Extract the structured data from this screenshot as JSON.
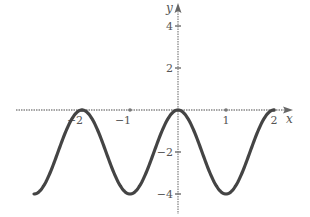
{
  "chart_data": {
    "type": "line",
    "title": "",
    "xlabel": "x",
    "ylabel": "y",
    "function": "y = 2cos(πx) - 2",
    "xlim": [
      -3,
      2.35
    ],
    "ylim": [
      -4.2,
      4.8
    ],
    "grid": false,
    "legend": null,
    "x_ticks": [
      {
        "value": -2,
        "label": "−2"
      },
      {
        "value": -1,
        "label": "−1"
      },
      {
        "value": 1,
        "label": "1"
      },
      {
        "value": 2,
        "label": "2"
      }
    ],
    "y_ticks": [
      {
        "value": 4,
        "label": "4"
      },
      {
        "value": 2,
        "label": "2"
      },
      {
        "value": -2,
        "label": "−2"
      },
      {
        "value": -4,
        "label": "−4"
      }
    ],
    "series": [
      {
        "name": "curve",
        "x": [
          -3,
          -2.5,
          -2,
          -1.5,
          -1,
          -0.5,
          0,
          0.5,
          1,
          1.5,
          2
        ],
        "y": [
          -4,
          -2,
          0,
          -2,
          -4,
          -2,
          0,
          -2,
          -4,
          -2,
          0
        ]
      }
    ],
    "key_points": {
      "maxima": [
        [
          -2,
          0
        ],
        [
          0,
          0
        ],
        [
          2,
          0
        ]
      ],
      "minima": [
        [
          -1,
          -4
        ],
        [
          1,
          -4
        ]
      ]
    },
    "colors": {
      "curve": "#444444",
      "axes": "#888888"
    }
  }
}
